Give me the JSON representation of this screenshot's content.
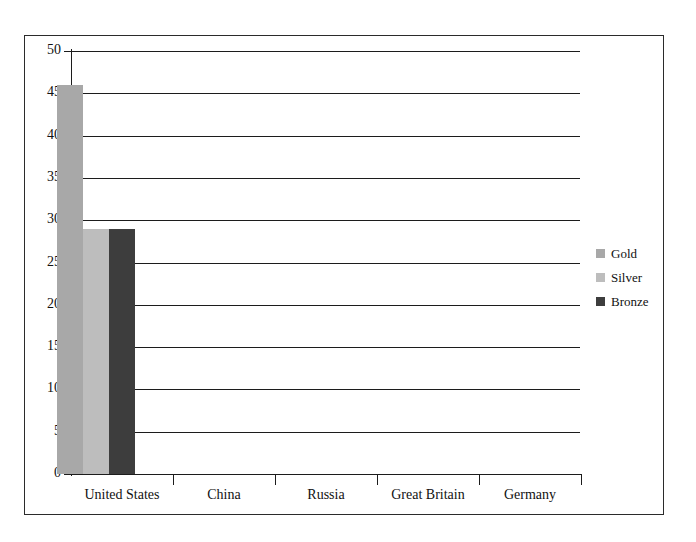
{
  "chart_data": {
    "type": "bar",
    "title": "",
    "subtitle": "",
    "xlabel": "",
    "ylabel": "",
    "categories": [
      "United States",
      "China",
      "Russia",
      "Great Britain",
      "Germany"
    ],
    "series": [
      {
        "name": "Gold",
        "color": "#a8a8a8",
        "values": [
          46,
          0,
          0,
          0,
          0
        ]
      },
      {
        "name": "Silver",
        "color": "#bdbdbd",
        "values": [
          29,
          0,
          0,
          0,
          0
        ]
      },
      {
        "name": "Bronze",
        "color": "#3d3d3d",
        "values": [
          29,
          0,
          0,
          0,
          0
        ]
      }
    ],
    "ylim": [
      0,
      50
    ],
    "ytick_step": 5,
    "yticks": [
      0,
      5,
      10,
      15,
      20,
      25,
      30,
      35,
      40,
      45,
      50
    ],
    "ytick_labels": [
      "0",
      "5",
      "10",
      "15",
      "20",
      "25",
      "30",
      "35",
      "40",
      "45",
      "50"
    ],
    "grid": "horizontal",
    "legend_position": "right",
    "legend_entries": [
      "Gold",
      "Silver",
      "Bronze"
    ],
    "annotations": [],
    "axis_color": "#1c1c1c",
    "grid_color": "#1c1c1c",
    "background_color": "#ffffff",
    "border_color": "#2b2b2b"
  }
}
